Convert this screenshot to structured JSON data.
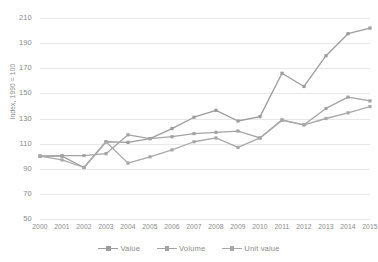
{
  "chart_data": {
    "type": "line",
    "title": "",
    "xlabel": "",
    "ylabel": "Index, 1990 = 100",
    "categories": [
      "2000",
      "2001",
      "2002",
      "2003",
      "2004",
      "2005",
      "2006",
      "2007",
      "2008",
      "2009",
      "2010",
      "2011",
      "2012",
      "2013",
      "2014",
      "2015"
    ],
    "x": [
      2000,
      2001,
      2002,
      2003,
      2004,
      2005,
      2006,
      2007,
      2008,
      2009,
      2010,
      2011,
      2012,
      2013,
      2014,
      2015
    ],
    "ylim": [
      50,
      210
    ],
    "xlim": [
      2000,
      2015
    ],
    "yticks": [
      50,
      70,
      90,
      110,
      130,
      150,
      170,
      190,
      210
    ],
    "ytick_labels": [
      "50",
      "70",
      "90",
      "110",
      "130",
      "150",
      "170",
      "190",
      "210"
    ],
    "grid": true,
    "grid_axis": "y",
    "legend_position": "bottom",
    "marker": "square",
    "series": [
      {
        "name": "Value",
        "color": "#9c9c9c",
        "values": [
          100,
          100,
          91,
          111.5,
          111,
          114,
          122,
          131,
          136.5,
          128,
          131.5,
          166,
          155.5,
          180,
          197.5,
          202
        ]
      },
      {
        "name": "Volume",
        "color": "#a3a3a3",
        "values": [
          100,
          100.5,
          100.5,
          102,
          117,
          114,
          115.5,
          118,
          119,
          120,
          114.5,
          129,
          125,
          138,
          147,
          144
        ]
      },
      {
        "name": "Unit value",
        "color": "#a8a8a8",
        "values": [
          100,
          97,
          91,
          111.5,
          94.5,
          99.5,
          105,
          111.5,
          114.5,
          107,
          114.5,
          128.5,
          125,
          130,
          134.5,
          139.5
        ]
      }
    ]
  },
  "legend": {
    "items": [
      {
        "label": "Value"
      },
      {
        "label": "Volume"
      },
      {
        "label": "Unit value"
      }
    ]
  },
  "axis": {
    "y_title": "Index, 1990 = 100"
  }
}
